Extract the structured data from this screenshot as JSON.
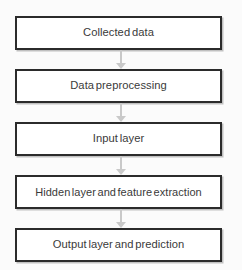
{
  "diagram": {
    "orientation": "vertical-top-to-bottom",
    "background_color": "#fbfbfb",
    "node_border_color": "#2b2b2b",
    "node_fill_color": "#ffffff",
    "text_color": "#3a3a3a",
    "connector_color": "#c9c9c9",
    "nodes": [
      {
        "id": "collected-data",
        "label": "Collected data"
      },
      {
        "id": "data-preprocessing",
        "label": "Data preprocessing"
      },
      {
        "id": "input-layer",
        "label": "Input layer"
      },
      {
        "id": "hidden-layer",
        "label": "Hidden layer and feature extraction"
      },
      {
        "id": "output-layer",
        "label": "Output layer and prediction"
      }
    ],
    "connectors": [
      {
        "from": "collected-data",
        "to": "data-preprocessing"
      },
      {
        "from": "data-preprocessing",
        "to": "input-layer"
      },
      {
        "from": "input-layer",
        "to": "hidden-layer"
      },
      {
        "from": "hidden-layer",
        "to": "output-layer"
      }
    ]
  }
}
